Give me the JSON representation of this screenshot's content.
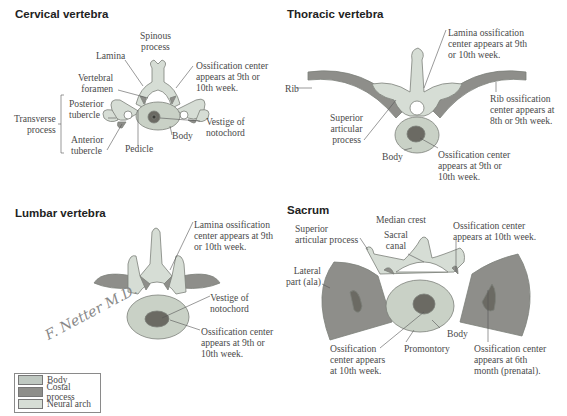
{
  "colors": {
    "body": "#bfc8c1",
    "costal_process": "#8e8e8a",
    "neural_arch": "#d6ddd5",
    "body_fill": "#c9d1c6",
    "ossification": "#6b6a63",
    "outline": "#7c807a"
  },
  "panels": {
    "cervical": {
      "title": "Cervical vertebra",
      "labels": {
        "spinous_process": "Spinous\nprocess",
        "lamina": "Lamina",
        "vertebral_foramen": "Vertebral\nforamen",
        "ossification_center": "Ossification center\nappears at 9th or\n10th week.",
        "transverse_process": "Transverse\nprocess",
        "posterior_tubercle": "Posterior\ntubercle",
        "anterior_tubercle": "Anterior\ntubercle",
        "pedicle": "Pedicle",
        "body": "Body",
        "vestige_notochord": "Vestige of\nnotochord"
      }
    },
    "thoracic": {
      "title": "Thoracic vertebra",
      "labels": {
        "lamina_ossification": "Lamina ossification\ncenter appears at 9th\nor 10th week.",
        "rib": "Rib",
        "rib_ossification": "Rib ossification\ncenter appears at\n8th or 9th week.",
        "superior_articular_process": "Superior\narticular\nprocess",
        "body": "Body",
        "ossification_center": "Ossification center\nappears at 9th or\n10th week."
      }
    },
    "lumbar": {
      "title": "Lumbar vertebra",
      "labels": {
        "lamina_ossification": "Lamina ossification\ncenter appears at 9th\nor 10th week.",
        "vestige_notochord": "Vestige of\nnotochord",
        "ossification_center": "Ossification center\nappears at 9th or\n10th week."
      },
      "signature": "F. Netter M.D."
    },
    "sacrum": {
      "title": "Sacrum",
      "labels": {
        "median_crest": "Median crest",
        "superior_articular_process": "Superior\narticular process",
        "sacral_canal": "Sacral\ncanal",
        "ossification_10th": "Ossification center\nappears at 10th week.",
        "lateral_part": "Lateral\npart (ala)",
        "body": "Body",
        "promontory": "Promontory",
        "ossification_body": "Ossification\ncenter appears\nat 10th week.",
        "ossification_6th_month": "Ossification center\nappears at 6th\nmonth (prenatal)."
      }
    }
  },
  "legend": {
    "items": [
      {
        "label": "Body",
        "color": "#bfc8c1"
      },
      {
        "label": "Costal process",
        "color": "#8e8e8a"
      },
      {
        "label": "Neural arch",
        "color": "#d6ddd5"
      }
    ]
  }
}
